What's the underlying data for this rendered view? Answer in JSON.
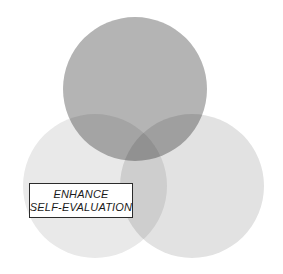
{
  "diagram": {
    "background_color": "#ffffff",
    "circles": [
      {
        "id": "top-circle",
        "name": "top-circle",
        "cx": 135,
        "cy": 89,
        "r": 72,
        "fill": "#b4b4b4"
      },
      {
        "id": "bottom-left-circle",
        "name": "bottom-left-circle",
        "cx": 95,
        "cy": 186,
        "r": 72,
        "fill": "#e9e9e9"
      },
      {
        "id": "bottom-right-circle",
        "name": "bottom-right-circle",
        "cx": 192,
        "cy": 186,
        "r": 72,
        "fill": "#e2e2e2"
      }
    ],
    "overlap_colors": {
      "top_and_right": "#a5a5a5",
      "top_and_left": "#aaaaaa",
      "left_and_right": "#d2d2d2",
      "all_three": "#9d9d9d"
    }
  },
  "label": {
    "name": "enhance-self-evaluation-label",
    "line1": "ENHANCE",
    "line2": "SELF-EVALUATION",
    "border_color": "#2b2b2b",
    "background_color": "#ffffff",
    "text_color": "#1a1a1a"
  }
}
